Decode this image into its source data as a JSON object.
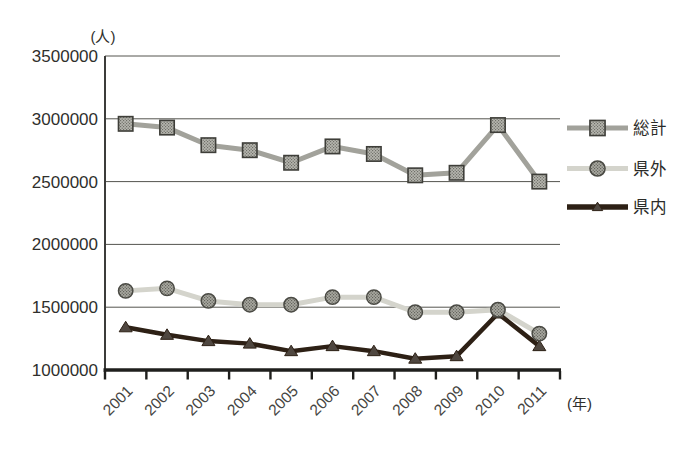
{
  "figure": {
    "background": "#ffffff",
    "text_color": "#2f2f2c",
    "axis_color": "#1f1f1d",
    "grid_color": "#54544f"
  },
  "chart_data": {
    "type": "line",
    "title": "",
    "unit_y_label": "(人)",
    "unit_x_label": "(年)",
    "categories": [
      "2001",
      "2002",
      "2003",
      "2004",
      "2005",
      "2006",
      "2007",
      "2008",
      "2009",
      "2010",
      "2011"
    ],
    "series": [
      {
        "key": "total",
        "name": "総計",
        "marker": "square",
        "line_color": "#a2a29b",
        "marker_fill_base": "#b6b6af",
        "marker_fill_dot": "#6f6f68",
        "marker_edge": "#3e3e39",
        "values": [
          2960000,
          2930000,
          2790000,
          2750000,
          2650000,
          2780000,
          2720000,
          2550000,
          2570000,
          2950000,
          2500000
        ]
      },
      {
        "key": "outside-prefecture",
        "name": "県外",
        "marker": "circle",
        "line_color": "#d4d4cc",
        "marker_fill_base": "#a9a9a1",
        "marker_fill_dot": "#63635c",
        "marker_edge": "#4a4a44",
        "values": [
          1630000,
          1650000,
          1550000,
          1520000,
          1520000,
          1580000,
          1580000,
          1460000,
          1460000,
          1480000,
          1290000
        ]
      },
      {
        "key": "inside-prefecture",
        "name": "県内",
        "marker": "triangle",
        "line_color": "#2d2015",
        "marker_fill_base": "#4f4740",
        "marker_edge": "#2d2015",
        "values": [
          1340000,
          1280000,
          1230000,
          1210000,
          1150000,
          1190000,
          1150000,
          1090000,
          1110000,
          1450000,
          1190000
        ]
      }
    ],
    "ylim": [
      1000000,
      3500000
    ],
    "ytick_interval": 500000,
    "yticks": [
      "3500000",
      "3000000",
      "2500000",
      "2000000",
      "1500000",
      "1000000"
    ],
    "grid": "horizontal",
    "legend_position": "right"
  }
}
